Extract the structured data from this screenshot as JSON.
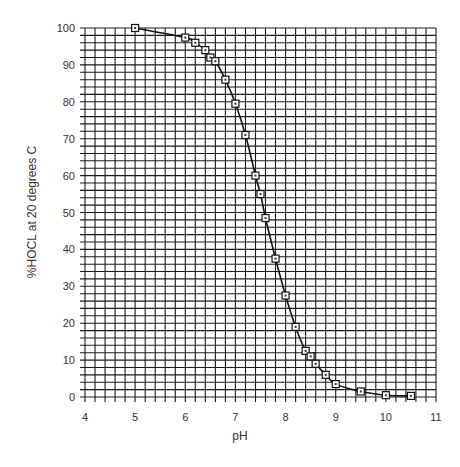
{
  "chart_data": {
    "type": "line",
    "title": "",
    "xlabel": "pH",
    "ylabel": "%HOCL at 20 degrees C",
    "xlim": [
      4,
      11
    ],
    "ylim": [
      0,
      100
    ],
    "xticks": [
      4,
      5,
      6,
      7,
      8,
      9,
      10,
      11
    ],
    "yticks": [
      0,
      10,
      20,
      30,
      40,
      50,
      60,
      70,
      80,
      90,
      100
    ],
    "grid": true,
    "grid_minor_x_step": 0.2,
    "grid_minor_y_step": 2,
    "legend": null,
    "marker": "square",
    "series": [
      {
        "name": "%HOCL",
        "x": [
          5.0,
          6.0,
          6.2,
          6.4,
          6.5,
          6.6,
          6.8,
          7.0,
          7.2,
          7.4,
          7.5,
          7.6,
          7.8,
          8.0,
          8.2,
          8.4,
          8.5,
          8.6,
          8.8,
          9.0,
          9.5,
          10.0,
          10.5
        ],
        "y": [
          100,
          97.4,
          96,
          94,
          92,
          91,
          86,
          79.5,
          71,
          60,
          55,
          48.5,
          37.5,
          27.5,
          19,
          12.5,
          11,
          9,
          6,
          3.5,
          1.5,
          0.5,
          0.3
        ]
      }
    ],
    "colors": {
      "line": "#111111",
      "grid": "#1a1a1a",
      "marker_fill": "#ffffff"
    }
  }
}
